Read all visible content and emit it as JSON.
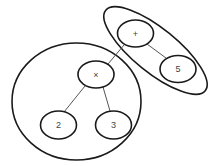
{
  "diagram": {
    "type": "expression-tree",
    "groups": [
      {
        "id": "subtree-multiply",
        "label": ""
      },
      {
        "id": "subtree-plus-5",
        "label": ""
      }
    ],
    "nodes": [
      {
        "id": "plus",
        "label": "+"
      },
      {
        "id": "times",
        "label": "×"
      },
      {
        "id": "five",
        "label": "5"
      },
      {
        "id": "two",
        "label": "2"
      },
      {
        "id": "three",
        "label": "3"
      }
    ],
    "edges": [
      {
        "from": "plus",
        "to": "times"
      },
      {
        "from": "plus",
        "to": "five"
      },
      {
        "from": "times",
        "to": "two"
      },
      {
        "from": "times",
        "to": "three"
      }
    ]
  }
}
